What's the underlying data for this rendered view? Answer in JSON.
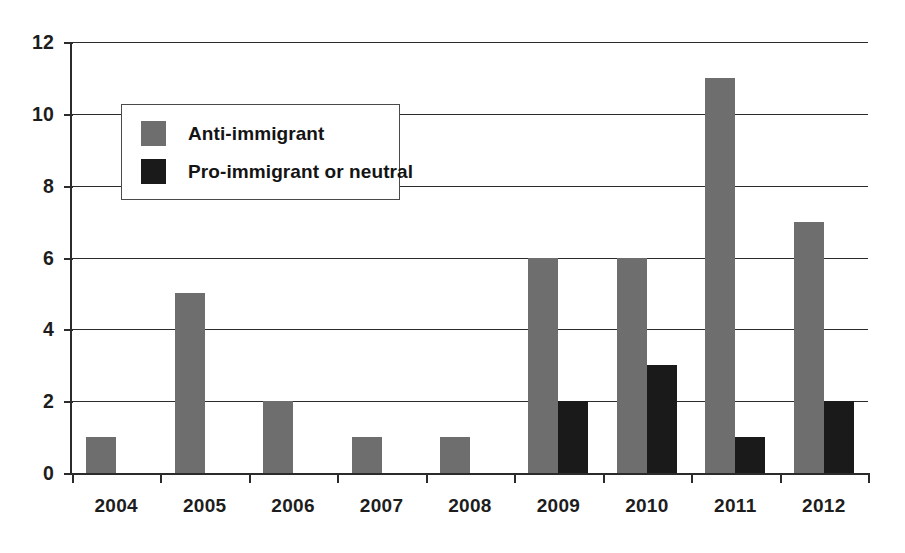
{
  "chart_data": {
    "type": "bar",
    "title": "",
    "subtitle": "",
    "xlabel": "",
    "ylabel": "",
    "categories": [
      "2004",
      "2005",
      "2006",
      "2007",
      "2008",
      "2009",
      "2010",
      "2011",
      "2012"
    ],
    "series": [
      {
        "name": "Anti-immigrant",
        "color": "#6e6e6e",
        "values": [
          1,
          5,
          2,
          1,
          1,
          6,
          6,
          11,
          7
        ]
      },
      {
        "name": "Pro-immigrant or neutral",
        "color": "#1a1a1a",
        "values": [
          0,
          0,
          0,
          0,
          0,
          2,
          3,
          1,
          2
        ]
      }
    ],
    "ylim": [
      0,
      12
    ],
    "ytick_labels": [
      "0",
      "2",
      "4",
      "6",
      "8",
      "10",
      "12"
    ],
    "ytick_values": [
      0,
      2,
      4,
      6,
      8,
      10,
      12
    ],
    "grid": true,
    "grid_axis": "y",
    "legend": {
      "position": "upper-left-inside",
      "entries": [
        {
          "label": "Anti-immigrant",
          "color": "#6e6e6e"
        },
        {
          "label": "Pro-immigrant or neutral",
          "color": "#1a1a1a"
        }
      ]
    },
    "background_color": "#ffffff",
    "axis_color": "#2b2b2b",
    "bar_group_mode": "grouped"
  }
}
